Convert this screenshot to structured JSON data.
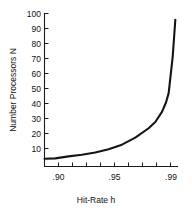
{
  "chart_data": {
    "type": "line",
    "title": "",
    "xlabel": "Hit-Rate h",
    "ylabel": "Number Processors N",
    "xlim": [
      0.892,
      0.992
    ],
    "ylim": [
      5,
      103
    ],
    "grid": false,
    "legend": null,
    "x_tick_values": [
      0.9,
      0.91,
      0.92,
      0.93,
      0.94,
      0.95,
      0.96,
      0.97,
      0.98,
      0.99
    ],
    "x_tick_labels": [
      ".90",
      "",
      "",
      "",
      "",
      ".95",
      "",
      "",
      "",
      ".99"
    ],
    "y_tick_values": [
      10,
      20,
      30,
      40,
      50,
      60,
      70,
      80,
      90,
      100
    ],
    "y_tick_labels": [
      "10",
      "20",
      "30",
      "40",
      "50",
      "60",
      "70",
      "80",
      "90",
      "100"
    ],
    "series": [
      {
        "name": "Number Processors N",
        "color": "#151515",
        "x": [
          0.892,
          0.9,
          0.91,
          0.92,
          0.93,
          0.94,
          0.95,
          0.96,
          0.97,
          0.975,
          0.98,
          0.983,
          0.985,
          0.988,
          0.99
        ],
        "y": [
          10.0,
          10.2,
          11.5,
          12.5,
          14.0,
          16.0,
          19.0,
          23.5,
          29.5,
          33.5,
          40.0,
          46.0,
          52.0,
          75.0,
          99.0
        ]
      }
    ]
  },
  "labels": {
    "x_axis_title": "Hit-Rate h",
    "y_axis_title": "Number Processors N",
    "tick_100": "100",
    "tick_90": "90",
    "tick_80": "80",
    "tick_70": "70",
    "tick_60": "60",
    "tick_50": "50",
    "tick_40": "40",
    "tick_30": "30",
    "tick_20": "20",
    "tick_10": "10",
    "tick_x_90": ".90",
    "tick_x_95": ".95",
    "tick_x_99": ".99"
  }
}
